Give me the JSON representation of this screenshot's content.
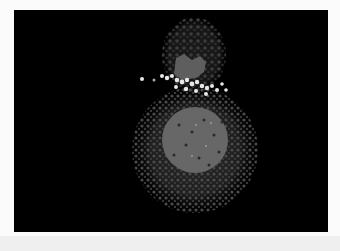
{
  "image": {
    "description": "Grayscale fluorescence microscopy image of an embryo-like specimen on black background",
    "background_color": "#000000",
    "frame_color": "#fbfbfb",
    "bottom_strip_color": "#efefef"
  },
  "specimen": {
    "upper_lobe": {
      "cx": 181,
      "cy": 45,
      "rx": 32,
      "ry": 38,
      "dot_color": "#3a3a3a"
    },
    "upper_patch": {
      "color": "#5e5e5e"
    },
    "bright_band": {
      "color": "#e8e8e8"
    },
    "lower_body": {
      "cx": 181,
      "cy": 140,
      "r": 62,
      "dot_color": "#333333"
    },
    "inner_disk": {
      "cx": 181,
      "cy": 130,
      "r": 33,
      "color": "#666666"
    }
  }
}
